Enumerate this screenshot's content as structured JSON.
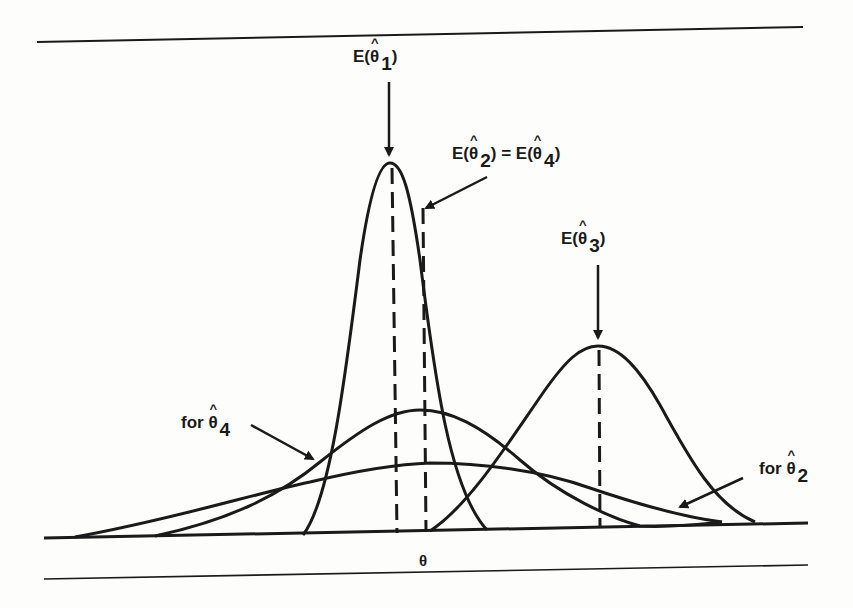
{
  "diagram": {
    "title": "",
    "axis_label": "θ",
    "labels": {
      "e_theta1": {
        "prefix": "E(",
        "symbol": "θ",
        "hat": "^",
        "subscript": "1",
        "suffix": ")"
      },
      "e_theta2_eq_theta4": {
        "left": {
          "prefix": "E(",
          "symbol": "θ",
          "hat": "^",
          "subscript": "2",
          "suffix": ")"
        },
        "equals": "=",
        "right": {
          "prefix": "E(",
          "symbol": "θ",
          "hat": "^",
          "subscript": "4",
          "suffix": ")"
        }
      },
      "e_theta3": {
        "prefix": "E(",
        "symbol": "θ",
        "hat": "^",
        "subscript": "3",
        "suffix": ")"
      },
      "for_theta4": {
        "prefix": "for ",
        "symbol": "θ",
        "hat": "^",
        "subscript": "4"
      },
      "for_theta2": {
        "prefix": "for ",
        "symbol": "θ",
        "hat": "^",
        "subscript": "2"
      }
    },
    "curves": [
      {
        "name": "theta1",
        "description": "narrow tall distribution centered at E(θ̂1)",
        "peak_x": 390,
        "peak_y": 163
      },
      {
        "name": "theta4",
        "description": "medium-width distribution centered at E(θ̂4)",
        "peak_x": 420,
        "peak_y": 410
      },
      {
        "name": "theta2",
        "description": "widest flat distribution centered at E(θ̂2)",
        "peak_x": 425,
        "peak_y": 463
      },
      {
        "name": "theta3",
        "description": "distribution shifted right centered at E(θ̂3)",
        "peak_x": 598,
        "peak_y": 346
      }
    ],
    "colors": {
      "ink": "#1a1a1a",
      "background": "#fdfdfc"
    }
  }
}
